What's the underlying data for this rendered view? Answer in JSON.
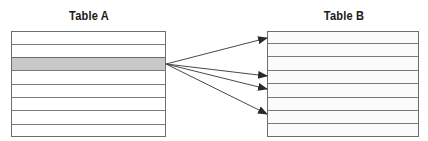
{
  "diagram": {
    "type": "one-to-many relationship",
    "table_a": {
      "title": "Table A",
      "row_count": 8,
      "highlighted_row_index": 2,
      "highlight_color": "#c8c8c8"
    },
    "table_b": {
      "title": "Table B",
      "row_count": 8,
      "linked_row_indices": [
        0,
        3,
        4,
        6
      ]
    },
    "arrows": [
      {
        "from": "table_a.row.2",
        "to": "table_b.row.0"
      },
      {
        "from": "table_a.row.2",
        "to": "table_b.row.3"
      },
      {
        "from": "table_a.row.2",
        "to": "table_b.row.4"
      },
      {
        "from": "table_a.row.2",
        "to": "table_b.row.6"
      }
    ],
    "colors": {
      "border": "#6e6e6e",
      "arrow": "#4a4a4a",
      "text": "#1a1a1a"
    }
  }
}
